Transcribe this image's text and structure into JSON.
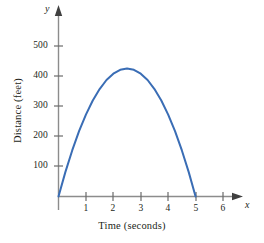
{
  "chart_data": {
    "type": "line",
    "title": "",
    "subtitle": "",
    "xlabel": "Time (seconds)",
    "ylabel": "Distance (feet)",
    "x_axis_variable": "x",
    "y_axis_variable": "y",
    "xlim": [
      0,
      6.6
    ],
    "ylim": [
      0,
      570
    ],
    "xticks": [
      1,
      2,
      3,
      4,
      5,
      6
    ],
    "xtick_labels": [
      "1",
      "2",
      "3",
      "4",
      "5",
      "6"
    ],
    "yticks": [
      100,
      200,
      300,
      400,
      500
    ],
    "ytick_labels": [
      "100",
      "200",
      "300",
      "400",
      "500"
    ],
    "grid": false,
    "legend": "none",
    "axis_arrows": true,
    "series": [
      {
        "name": "Distance vs time",
        "color": "#3a6db5",
        "line_width": 2,
        "x": [
          0,
          0.25,
          0.5,
          0.75,
          1,
          1.25,
          1.5,
          1.75,
          2,
          2.25,
          2.5,
          2.75,
          3,
          3.25,
          3.5,
          3.75,
          4,
          4.25,
          4.5,
          4.75,
          5
        ],
        "values": [
          0,
          81,
          153,
          217,
          272,
          319,
          357,
          387,
          408,
          421,
          425,
          421,
          408,
          387,
          357,
          319,
          272,
          217,
          153,
          81,
          0
        ]
      }
    ],
    "annotations": {
      "x_intercepts": [
        0,
        5
      ],
      "vertex": {
        "x": 2.5,
        "y": 425
      }
    }
  },
  "axis_labels": {
    "x_title": "Time (seconds)",
    "y_title": "Distance (feet)",
    "x_var": "x",
    "y_var": "y"
  }
}
